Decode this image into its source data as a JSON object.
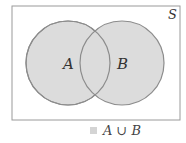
{
  "diagram": {
    "type": "venn",
    "universe": {
      "label": "S",
      "x": 12,
      "y": 6,
      "width": 168,
      "height": 114
    },
    "sets": [
      {
        "label": "A",
        "cx": 68,
        "cy": 63,
        "r": 42
      },
      {
        "label": "B",
        "cx": 122,
        "cy": 63,
        "r": 42
      }
    ],
    "shaded_region": "A ∪ B",
    "colors": {
      "fill": "#dcdcdc",
      "circle_stroke": "#8c8c8c",
      "rect_stroke": "#9a9a9a",
      "legend_swatch": "#d4d4d4"
    }
  },
  "legend": {
    "label": "A ∪ B"
  }
}
